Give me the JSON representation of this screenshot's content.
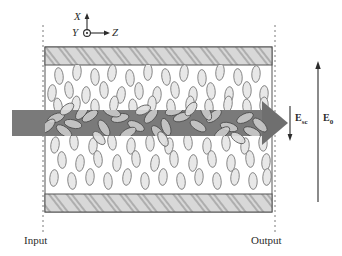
{
  "figure": {
    "type": "photorefractive-liquid-crystal-cell-diagram",
    "background_color": "#ffffff",
    "ink_color": "#2b2b2b"
  },
  "axes_indicator": {
    "name": "coordinate-axes",
    "x_label": "X",
    "y_label": "Y",
    "z_label": "Z",
    "y_symbol": "out-of-page-dot",
    "origin_px": [
      87,
      33
    ],
    "x_arrow_direction": "up",
    "z_arrow_direction": "right"
  },
  "cell": {
    "left_edge_px": 45,
    "right_edge_px": 272,
    "top_edge_px": 47,
    "bottom_edge_px": 212,
    "border_color": "#555555",
    "interior_color": "#ffffff",
    "electrode_fill": "#d8d8d8",
    "electrode_hatch_color": "#8c8c8c",
    "top_electrode": {
      "y_px": 47,
      "height_px": 18
    },
    "bottom_electrode": {
      "y_px": 194,
      "height_px": 18
    }
  },
  "beam": {
    "name": "laser-beam",
    "color": "#7a7a7a",
    "shaft_left_px": 12,
    "shaft_right_px": 262,
    "shaft_top_px": 110,
    "shaft_height_px": 26,
    "arrow_tip_px": 288,
    "arrow_half_height_px": 22,
    "direction": "left-to-right"
  },
  "molecules": {
    "name": "liquid-crystal-director-ellipses",
    "fill": "#e6e6e6",
    "stroke": "#6e6e6e",
    "aligned_orientation_deg": 0,
    "beam_region_note": "reoriented / tilted inside beam",
    "outside_count": 104,
    "inside_count": 36
  },
  "field_labels": {
    "space_charge": {
      "text": "E",
      "subscript": "sc",
      "arrow_direction": "down",
      "arrow_x_px": 290,
      "arrow_top_px": 106,
      "arrow_bottom_px": 140
    },
    "applied": {
      "text": "E",
      "subscript": "0",
      "arrow_direction": "up",
      "arrow_x_px": 318,
      "arrow_top_px": 62,
      "arrow_bottom_px": 202
    }
  },
  "end_labels": {
    "input": "Input",
    "output": "Output",
    "input_dashed_x_px": 43,
    "output_dashed_x_px": 275,
    "dash_top_px": 25,
    "dash_bottom_px": 235
  }
}
